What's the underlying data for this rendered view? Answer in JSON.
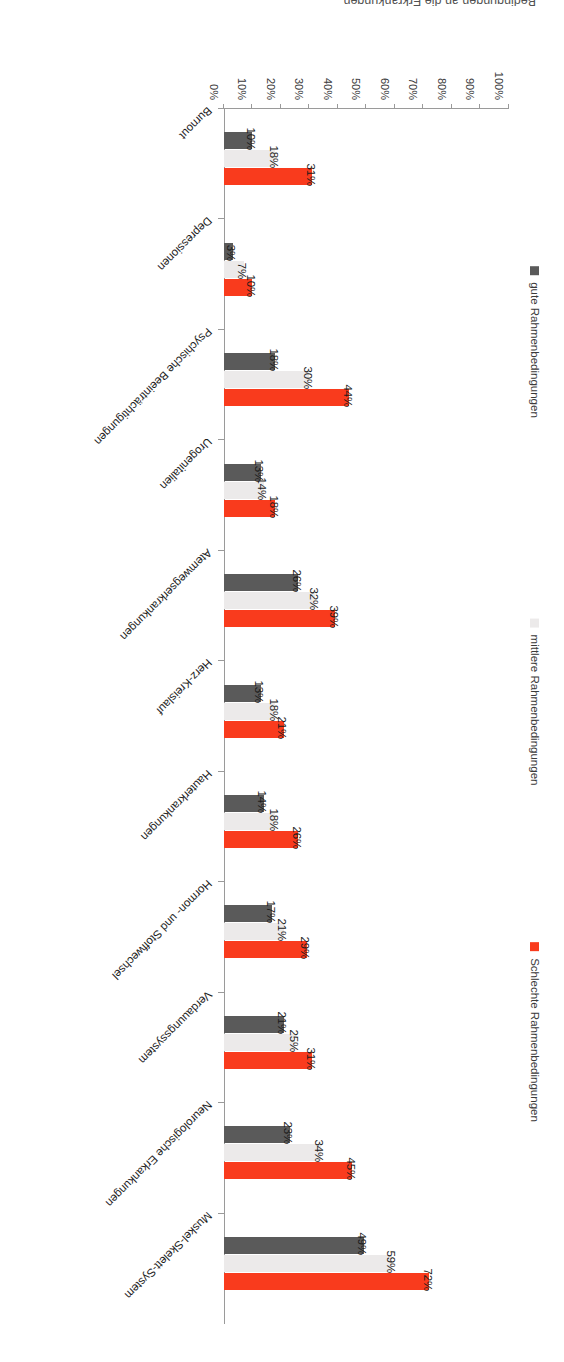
{
  "caption": "Bedingungen an die Erkrankungen",
  "legend": {
    "items": [
      {
        "label": "Schlechte Rahmenbedingungen",
        "color": "#f93b1d"
      },
      {
        "label": "mittlere Rahmenbedingungen",
        "color": "#eceaea"
      },
      {
        "label": "gute Rahmenbedingungen",
        "color": "#5a5a5a"
      }
    ]
  },
  "axis": {
    "ticks": [
      "0%",
      "10%",
      "20%",
      "30%",
      "40%",
      "50%",
      "60%",
      "70%",
      "80%",
      "90%",
      "100%"
    ]
  },
  "chart_data": {
    "type": "bar",
    "title": "",
    "xlabel": "",
    "ylabel": "",
    "ylim": [
      0,
      100
    ],
    "grid": false,
    "legend_position": "left",
    "orientation": "vertical-grouped",
    "categories": [
      "Muskel-Skelett-System",
      "Neurologische Erkankungen",
      "Verdauungssystem",
      "Hormon- und Stoffwechsel",
      "Hauterkrankungen",
      "Herz-Kreislauf",
      "Atemwegserkrankungen",
      "Urogenitalien",
      "Psychische Beeinträchtigungen",
      "Depressionen",
      "Burnout"
    ],
    "series": [
      {
        "name": "Schlechte Rahmenbedingungen",
        "color": "#f93b1d",
        "values": [
          72,
          45,
          31,
          29,
          26,
          21,
          39,
          18,
          44,
          10,
          31
        ],
        "labels": [
          "72%",
          "45%",
          "31%",
          "29%",
          "26%",
          "21%",
          "39%",
          "18%",
          "44%",
          "10%",
          "31%"
        ]
      },
      {
        "name": "mittlere Rahmenbedingungen",
        "color": "#eceaea",
        "values": [
          59,
          34,
          25,
          21,
          18,
          18,
          32,
          14,
          30,
          7,
          18
        ],
        "labels": [
          "59%",
          "34%",
          "25%",
          "21%",
          "18%",
          "18%",
          "32%",
          "14%",
          "30%",
          "7%",
          "18%"
        ]
      },
      {
        "name": "gute Rahmenbedingungen",
        "color": "#5a5a5a",
        "values": [
          49,
          23,
          21,
          17,
          14,
          13,
          26,
          13,
          18,
          3,
          10
        ],
        "labels": [
          "49%",
          "23%",
          "21%",
          "17%",
          "14%",
          "13%",
          "26%",
          "13%",
          "18%",
          "3%",
          "10%"
        ]
      }
    ]
  }
}
